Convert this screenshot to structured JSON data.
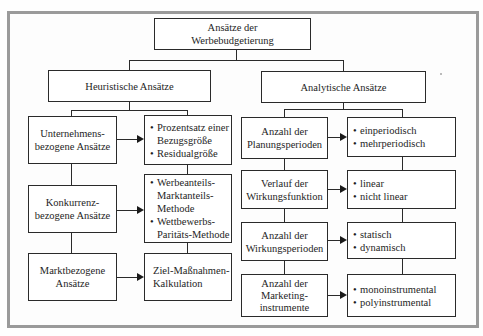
{
  "diagram": {
    "root": {
      "lines": [
        "Ansätze der",
        "Werbebudgetierung"
      ]
    },
    "branches": [
      {
        "title": "Heuristische Ansätze",
        "rows": [
          {
            "category": [
              "Unternehmens-",
              "bezogene Ansätze"
            ],
            "items": [
              {
                "bullet": "•",
                "lines": [
                  "Prozentsatz einer",
                  "Bezugsgröße"
                ]
              },
              {
                "bullet": "•",
                "lines": [
                  "Residualgröße"
                ]
              }
            ]
          },
          {
            "category": [
              "Konkurrenz-",
              "bezogene Ansätze"
            ],
            "items": [
              {
                "bullet": "•",
                "lines": [
                  "Werbeanteils-",
                  "Marktanteils-",
                  "Methode"
                ]
              },
              {
                "bullet": "•",
                "lines": [
                  "Wettbewerbs-",
                  "Paritäts-Methode"
                ]
              }
            ]
          },
          {
            "category": [
              "Marktbezogene",
              "Ansätze"
            ],
            "items": [
              {
                "bullet": "",
                "lines": [
                  "Ziel-Maßnahmen-",
                  "Kalkulation"
                ]
              }
            ]
          }
        ]
      },
      {
        "title": "Analytische Ansätze",
        "rows": [
          {
            "category": [
              "Anzahl der",
              "Planungsperioden"
            ],
            "items": [
              {
                "bullet": "•",
                "lines": [
                  "einperiodisch"
                ]
              },
              {
                "bullet": "•",
                "lines": [
                  "mehrperiodisch"
                ]
              }
            ]
          },
          {
            "category": [
              "Verlauf der",
              "Wirkungsfunktion"
            ],
            "items": [
              {
                "bullet": "•",
                "lines": [
                  "linear"
                ]
              },
              {
                "bullet": "•",
                "lines": [
                  "nicht linear"
                ]
              }
            ]
          },
          {
            "category": [
              "Anzahl der",
              "Wirkungsperioden"
            ],
            "items": [
              {
                "bullet": "•",
                "lines": [
                  "statisch"
                ]
              },
              {
                "bullet": "•",
                "lines": [
                  "dynamisch"
                ]
              }
            ]
          },
          {
            "category": [
              "Anzahl der",
              "Marketing-",
              "instrumente"
            ],
            "items": [
              {
                "bullet": "•",
                "lines": [
                  "monoinstrumental"
                ]
              },
              {
                "bullet": "•",
                "lines": [
                  "polyinstrumental"
                ]
              }
            ]
          }
        ]
      }
    ]
  },
  "colors": {
    "frame": "#9a9a9a",
    "line": "#2a2a2a",
    "background": "#fefefe"
  }
}
